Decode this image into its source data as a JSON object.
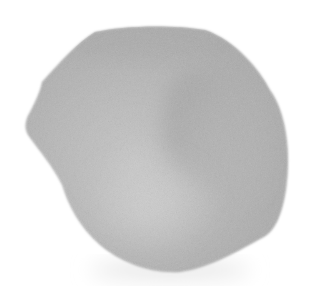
{
  "image": {
    "subject": "grayscale petal-shaped object on white background",
    "background_color": "#ffffff",
    "object_colors": {
      "light": "#c9c9c9",
      "mid": "#b4b4b4",
      "dark": "#a2a2a2",
      "fold_shadow": "#9a9a9a"
    },
    "alt": "Gray rounded petal-like shape with a curved darker fold"
  }
}
